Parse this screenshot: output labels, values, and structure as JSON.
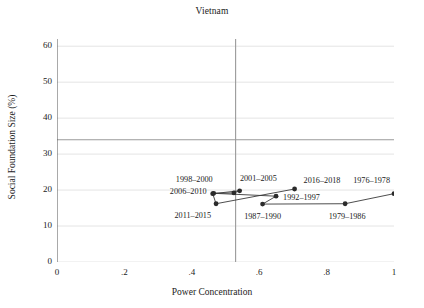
{
  "chart_data": {
    "type": "scatter",
    "title": "Vietnam",
    "xlabel": "Power Concentration",
    "ylabel": "Social Foundation Size (%)",
    "xlim": [
      0,
      1
    ],
    "ylim": [
      0,
      62
    ],
    "grid": true,
    "legend": "none",
    "xticks": [
      "0",
      ".2",
      ".4",
      ".6",
      ".8",
      "1"
    ],
    "xtick_values": [
      0,
      0.2,
      0.4,
      0.6,
      0.8,
      1
    ],
    "yticks": [
      "0",
      "10",
      "20",
      "30",
      "40",
      "50",
      "60"
    ],
    "ytick_values": [
      0,
      10,
      20,
      30,
      40,
      50,
      60
    ],
    "reference_lines": [
      {
        "name": "social-foundation-threshold",
        "orientation": "horizontal",
        "value": 34
      },
      {
        "name": "power-concentration-threshold",
        "orientation": "vertical",
        "value": 0.53
      }
    ],
    "series_name": "Vietnam period trajectory",
    "connected": true,
    "points": [
      {
        "label": "1998–2000",
        "x": 0.465,
        "y": 19.1,
        "label_dx": -1,
        "label_dy": -13,
        "label_anchor": "end"
      },
      {
        "label": "2006–2010",
        "x": 0.462,
        "y": 19.0,
        "label_dx": -6,
        "label_dy": -2,
        "label_anchor": "end"
      },
      {
        "label": "2011–2015",
        "x": 0.472,
        "y": 16.2,
        "label_dx": -5,
        "label_dy": 12,
        "label_anchor": "end"
      },
      {
        "label": "2001–2005",
        "x": 0.525,
        "y": 19.2,
        "label_dx": 6,
        "label_dy": -14,
        "label_anchor": "start"
      },
      {
        "label": "2001–2005b",
        "x": 0.542,
        "y": 19.8,
        "label_dx": 0,
        "label_dy": 0,
        "label_anchor": "none"
      },
      {
        "label": "1987–1990",
        "x": 0.61,
        "y": 16.1,
        "label_dx": 0,
        "label_dy": 13,
        "label_anchor": "middle"
      },
      {
        "label": "1992–1997",
        "x": 0.65,
        "y": 18.3,
        "label_dx": 7,
        "label_dy": 2,
        "label_anchor": "start"
      },
      {
        "label": "2016–2018",
        "x": 0.705,
        "y": 20.3,
        "label_dx": 9,
        "label_dy": -8,
        "label_anchor": "start"
      },
      {
        "label": "1979–1986",
        "x": 0.855,
        "y": 16.2,
        "label_dx": 2,
        "label_dy": 13,
        "label_anchor": "middle"
      },
      {
        "label": "1976–1978",
        "x": 1.0,
        "y": 19.0,
        "label_dx": -4,
        "label_dy": -13,
        "label_anchor": "end"
      }
    ],
    "path_order": [
      "1976–1978",
      "1979–1986",
      "1987–1990",
      "1992–1997",
      "1998–2000",
      "2001–2005",
      "2001–2005b",
      "2006–2010",
      "2011–2015",
      "2016–2018"
    ],
    "colors": {
      "marker": "#2b2b2b",
      "line": "#3a3a3a",
      "grid": "#e4e4e4",
      "axis": "#555555",
      "reference_line": "#9a9a9a",
      "text": "#1b1b1b"
    }
  }
}
